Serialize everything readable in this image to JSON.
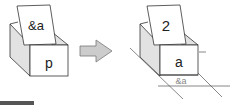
{
  "diagram": {
    "left_box": {
      "card_label": "&a",
      "box_label": "p"
    },
    "arrow": {
      "direction": "right",
      "fill": "#cccccc"
    },
    "right_box": {
      "card_label": "2",
      "box_label": "a",
      "address_label": "&a"
    }
  },
  "colors": {
    "stroke": "#333333",
    "side_face": "#e2e2e2",
    "face": "#ffffff",
    "address_text": "#888888"
  }
}
